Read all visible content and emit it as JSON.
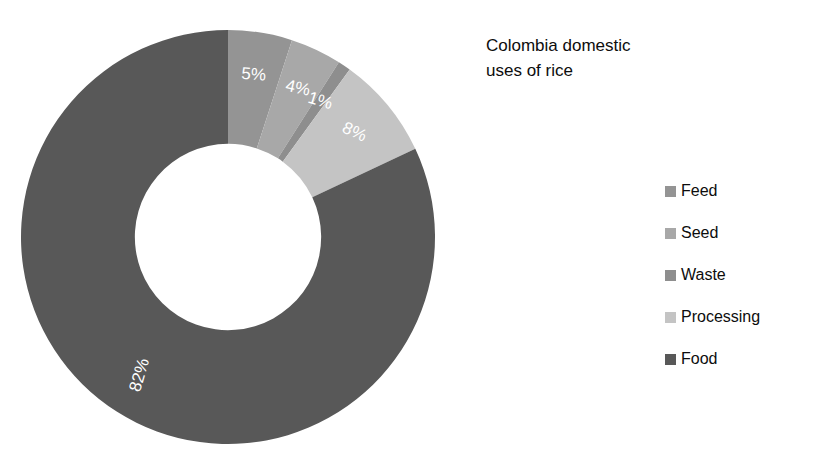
{
  "title": {
    "text": "Colombia domestic\nuses of rice"
  },
  "chart_data": {
    "type": "pie",
    "variant": "donut",
    "title": "Colombia domestic uses of rice",
    "xlabel": "",
    "ylabel": "",
    "units": "percent",
    "start_angle_deg": 0,
    "direction": "clockwise",
    "inner_radius_ratio": 0.45,
    "legend_position": "right",
    "grid": false,
    "background": "#ffffff",
    "categories": [
      "Feed",
      "Seed",
      "Waste",
      "Processing",
      "Food"
    ],
    "values": [
      5,
      4,
      1,
      8,
      82
    ],
    "labels": [
      "5%",
      "4%",
      "1%",
      "8%",
      "82%"
    ],
    "colors": [
      "#949494",
      "#a8a8a8",
      "#8e8e8e",
      "#c4c4c4",
      "#585858"
    ],
    "slices": [
      {
        "name": "Feed",
        "value": 5,
        "label": "5%",
        "color": "#949494"
      },
      {
        "name": "Seed",
        "value": 4,
        "label": "4%",
        "color": "#a8a8a8"
      },
      {
        "name": "Waste",
        "value": 1,
        "label": "1%",
        "color": "#8e8e8e"
      },
      {
        "name": "Processing",
        "value": 8,
        "label": "8%",
        "color": "#c4c4c4"
      },
      {
        "name": "Food",
        "value": 82,
        "label": "82%",
        "color": "#585858"
      }
    ],
    "label_color": "#ffffff",
    "total": 100
  },
  "legend": {
    "items": [
      {
        "label": "Feed",
        "color": "#949494"
      },
      {
        "label": "Seed",
        "color": "#a8a8a8"
      },
      {
        "label": "Waste",
        "color": "#8e8e8e"
      },
      {
        "label": "Processing",
        "color": "#c4c4c4"
      },
      {
        "label": "Food",
        "color": "#585858"
      }
    ]
  }
}
